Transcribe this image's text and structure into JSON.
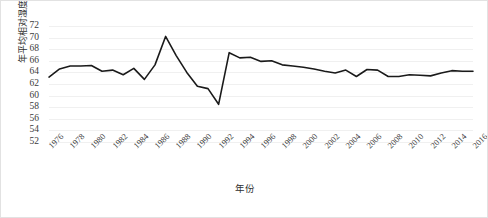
{
  "chart_data": {
    "type": "line",
    "title": "",
    "xlabel": "年份",
    "ylabel": "年平均相对湿度/%",
    "xlim": [
      1976,
      2016
    ],
    "ylim": [
      52,
      72
    ],
    "ytick_step": 2,
    "xtick_step": 2,
    "grid": true,
    "legend": "none",
    "line_color": "#1a1a1a",
    "background_color": "#ffffff",
    "grid_color": "#f0f0f0",
    "border_color": "#e2e2e2",
    "yticks": [
      52,
      54,
      56,
      58,
      60,
      62,
      64,
      66,
      68,
      70,
      72
    ],
    "xticks": [
      1976,
      1978,
      1980,
      1982,
      1984,
      1986,
      1988,
      1990,
      1992,
      1994,
      1996,
      1998,
      2000,
      2002,
      2004,
      2006,
      2008,
      2010,
      2012,
      2014,
      2016
    ],
    "x": [
      1976,
      1977,
      1978,
      1979,
      1980,
      1981,
      1982,
      1983,
      1984,
      1985,
      1986,
      1987,
      1988,
      1989,
      1990,
      1991,
      1992,
      1993,
      1994,
      1995,
      1996,
      1997,
      1998,
      1999,
      2000,
      2001,
      2002,
      2003,
      2004,
      2005,
      2006,
      2007,
      2008,
      2009,
      2010,
      2011,
      2012,
      2013,
      2014,
      2015,
      2016
    ],
    "values": [
      63.2,
      64.6,
      65.1,
      65.1,
      65.2,
      64.2,
      64.4,
      63.6,
      64.7,
      62.8,
      65.3,
      70.2,
      66.9,
      64.0,
      61.6,
      61.2,
      58.5,
      67.4,
      66.5,
      66.6,
      65.9,
      66.0,
      65.3,
      65.1,
      64.9,
      64.6,
      64.2,
      63.9,
      64.4,
      63.3,
      64.5,
      64.4,
      63.3,
      63.3,
      63.6,
      63.5,
      63.4,
      63.9,
      64.3,
      64.2,
      64.2
    ]
  }
}
